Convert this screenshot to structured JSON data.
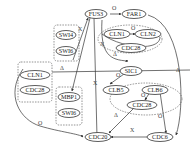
{
  "diagram": {
    "type": "gene-regulatory-network",
    "nodes": [
      {
        "id": "FUS3",
        "label": "FUS3"
      },
      {
        "id": "FAR1",
        "label": "FAR1"
      },
      {
        "id": "CLN1a",
        "label": "CLN1"
      },
      {
        "id": "CLN2",
        "label": "CLN2"
      },
      {
        "id": "CDC28a",
        "label": "CDC28"
      },
      {
        "id": "SWI4",
        "label": "SWI4"
      },
      {
        "id": "SWI6a",
        "label": "SWI6"
      },
      {
        "id": "SIC1",
        "label": "SIC1"
      },
      {
        "id": "CLN1b",
        "label": "CLN1"
      },
      {
        "id": "CDC28b",
        "label": "CDC28"
      },
      {
        "id": "MBP1",
        "label": "MBP1"
      },
      {
        "id": "SWI6b",
        "label": "SWI6"
      },
      {
        "id": "CLB5",
        "label": "CLB5"
      },
      {
        "id": "CLB6",
        "label": "CLB6"
      },
      {
        "id": "CDC28c",
        "label": "CDC28"
      },
      {
        "id": "CDC20",
        "label": "CDC20"
      },
      {
        "id": "CDC6",
        "label": "CDC6"
      }
    ],
    "groups": [
      {
        "id": "SBF",
        "members": [
          "SWI4",
          "SWI6a"
        ],
        "shape": "dashed-box"
      },
      {
        "id": "CLN1_CDC28_left",
        "members": [
          "CLN1b",
          "CDC28b"
        ],
        "shape": "dashed-box"
      },
      {
        "id": "MBF",
        "members": [
          "MBP1",
          "SWI6b"
        ],
        "shape": "dashed-box"
      },
      {
        "id": "CLN_complex",
        "members": [
          "CLN1a",
          "CLN2",
          "CDC28a"
        ],
        "shape": "dashed-ellipse"
      },
      {
        "id": "CLB_complex",
        "members": [
          "CLB5",
          "CLB6",
          "CDC28c"
        ],
        "shape": "dashed-ellipse"
      }
    ],
    "edge_labels": {
      "circle": "O",
      "triangle": "Δ",
      "cross": "X"
    },
    "edges": [
      {
        "from": "FUS3",
        "to": "FAR1",
        "label": "O"
      },
      {
        "from": "CLN1a",
        "to": "CLN2",
        "label": "O"
      },
      {
        "from": "SWI4",
        "to": "FUS3",
        "label": "X"
      },
      {
        "from": "FAR1",
        "to": "CDC6",
        "label": "Δ"
      },
      {
        "from": "CLN_complex",
        "to": "SIC1",
        "label": "Δ"
      },
      {
        "from": "SIC1",
        "to": "CLB5",
        "label": "O"
      },
      {
        "from": "CLB6",
        "to": "CDC28c",
        "label": "O"
      },
      {
        "from": "CDC28c",
        "to": "CDC20",
        "label": "Δ"
      },
      {
        "from": "CLB6",
        "to": "CDC6",
        "label": "O"
      },
      {
        "from": "CDC6",
        "to": "CDC20",
        "label": "X"
      },
      {
        "from": "CLN1b",
        "to": "CDC20",
        "label": "O"
      },
      {
        "from": "FUS3",
        "to": "CDC20",
        "label": "X"
      },
      {
        "from": "FUS3",
        "to": "MBP1",
        "label": ""
      },
      {
        "from": "SBF",
        "to": "CLN1_CDC28_left",
        "label": "Δ"
      },
      {
        "from": "CLN2",
        "to": "FUS3",
        "label": "X"
      }
    ]
  }
}
